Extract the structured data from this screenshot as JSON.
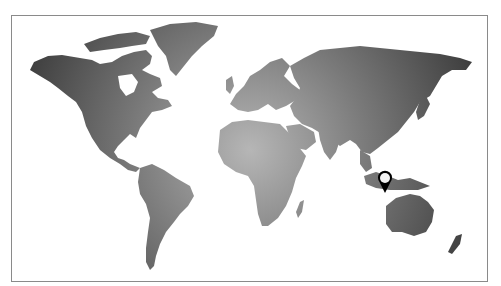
{
  "map": {
    "type": "world-map",
    "style": "grayscale-radial-gradient",
    "colors": {
      "land_center": "#b4b4b4",
      "land_edge": "#3a3a3a",
      "frame_border": "#8a8a8a",
      "background": "#ffffff",
      "pin_outline": "#000000",
      "pin_fill": "#f2f2f2"
    }
  },
  "marker": {
    "icon": "map-pin-icon",
    "region": "Indonesia (Sulawesi / Java Sea)",
    "x": 385,
    "y": 180
  }
}
